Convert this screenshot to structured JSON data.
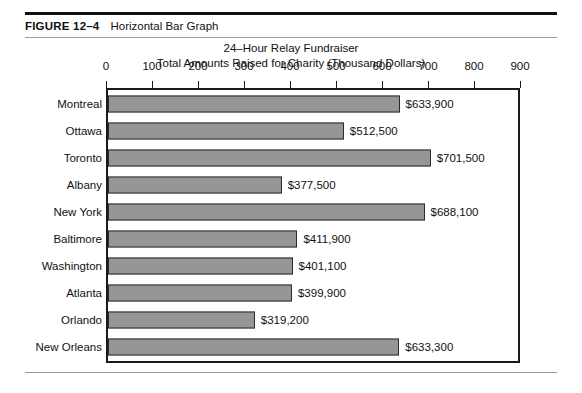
{
  "figure": {
    "number": "FIGURE 12–4",
    "title": "Horizontal Bar Graph"
  },
  "chart_data": {
    "type": "bar",
    "orientation": "horizontal",
    "title": "24–Hour Relay Fundraiser",
    "subtitle": "Total Amounts Raised for Charity (Thousand Dollars)",
    "xlabel": "",
    "ylabel": "",
    "xlim": [
      0,
      900
    ],
    "xticks": [
      0,
      100,
      200,
      300,
      400,
      500,
      600,
      700,
      800,
      900
    ],
    "xtick_labels": [
      "0",
      "100",
      "200",
      "300",
      "400",
      "500",
      "600",
      "700",
      "800",
      "900"
    ],
    "grid": false,
    "legend": null,
    "bar_color": "#969696",
    "bar_edge_color": "#2b2b2b",
    "categories": [
      "Montreal",
      "Ottawa",
      "Toronto",
      "Albany",
      "New York",
      "Baltimore",
      "Washington",
      "Atlanta",
      "Orlando",
      "New Orleans"
    ],
    "values": [
      633.9,
      512.5,
      701.5,
      377.5,
      688.1,
      411.9,
      401.1,
      399.9,
      319.2,
      633.3
    ],
    "data_labels": [
      "$633,900",
      "$512,500",
      "$701,500",
      "$377,500",
      "$688,100",
      "$411,900",
      "$401,100",
      "$399,900",
      "$319,200",
      "$633,300"
    ]
  }
}
